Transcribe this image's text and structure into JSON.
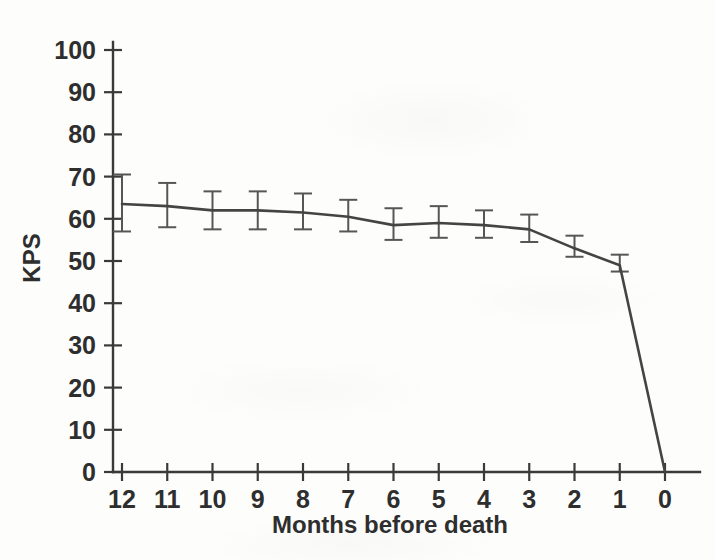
{
  "chart_data": {
    "type": "line",
    "title": "",
    "xlabel": "Months before death",
    "ylabel": "KPS",
    "x": [
      12,
      11,
      10,
      9,
      8,
      7,
      6,
      5,
      4,
      3,
      2,
      1,
      0
    ],
    "categories": [
      "12",
      "11",
      "10",
      "9",
      "8",
      "7",
      "6",
      "5",
      "4",
      "3",
      "2",
      "1",
      "0"
    ],
    "values": [
      63.5,
      63.0,
      62.0,
      62.0,
      61.5,
      60.5,
      58.5,
      59.0,
      58.5,
      57.5,
      53.0,
      49.0,
      0.0
    ],
    "error_low": [
      57.0,
      58.0,
      57.5,
      57.5,
      57.5,
      57.0,
      55.0,
      55.5,
      55.5,
      54.5,
      51.0,
      47.5,
      null
    ],
    "error_high": [
      70.5,
      68.5,
      66.5,
      66.5,
      66.0,
      64.5,
      62.5,
      63.0,
      62.0,
      61.0,
      56.0,
      51.5,
      null
    ],
    "series": [
      {
        "name": "KPS mean",
        "values": [
          63.5,
          63.0,
          62.0,
          62.0,
          61.5,
          60.5,
          58.5,
          59.0,
          58.5,
          57.5,
          53.0,
          49.0,
          0.0
        ]
      }
    ],
    "xlim": [
      12,
      0
    ],
    "ylim": [
      0,
      100
    ],
    "ytick_labels": [
      "100",
      "90",
      "80",
      "70",
      "60",
      "50",
      "40",
      "30",
      "20",
      "10",
      "0"
    ],
    "yticks": [
      100,
      90,
      80,
      70,
      60,
      50,
      40,
      30,
      20,
      10,
      0
    ],
    "xtick_labels": [
      "12",
      "11",
      "10",
      "9",
      "8",
      "7",
      "6",
      "5",
      "4",
      "3",
      "2",
      "1",
      "0"
    ],
    "xticks": [
      12,
      11,
      10,
      9,
      8,
      7,
      6,
      5,
      4,
      3,
      2,
      1,
      0
    ],
    "grid": false,
    "legend": null,
    "legend_position": "none",
    "x_axis_direction": "descending",
    "annotations": [],
    "colors": {
      "line": "#444444",
      "errorbar": "#565656",
      "axis": "#3a3a3a",
      "text": "#2e2e2e",
      "background": "#fdfdfc"
    }
  }
}
